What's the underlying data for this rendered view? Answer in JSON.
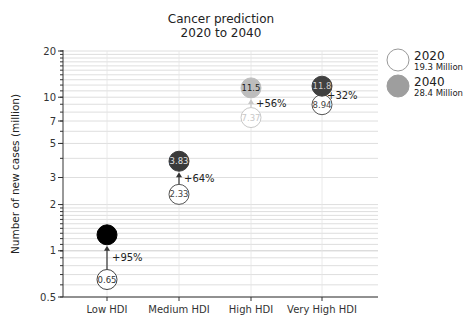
{
  "chart_data": {
    "type": "scatter",
    "title": "Cancer prediction\n2020 to 2040",
    "title_lines": [
      "Cancer prediction",
      "2020 to 2040"
    ],
    "xlabel": "",
    "ylabel": "Number of new cases (million)",
    "yscale": "log",
    "ylim": [
      0.5,
      20
    ],
    "yticks": [
      0.5,
      1,
      2,
      3,
      5,
      7,
      10,
      20
    ],
    "ytick_labels": [
      "0.5",
      "1",
      "2",
      "3",
      "5",
      "7",
      "10",
      "20"
    ],
    "categories": [
      "Low HDI",
      "Medium HDI",
      "High HDI",
      "Very High HDI"
    ],
    "grid": true,
    "legend_position": "right",
    "series": [
      {
        "name": "2020",
        "subtitle": "19.3 Million",
        "values": [
          0.65,
          2.33,
          7.37,
          8.94
        ],
        "labels": [
          "0.65",
          "2.33",
          "7.37",
          "8.94"
        ],
        "style": "hollow"
      },
      {
        "name": "2040",
        "subtitle": "28.4 Million",
        "values": [
          1.27,
          3.83,
          11.5,
          11.8
        ],
        "labels": [
          "1.27",
          "3.83",
          "11.5",
          "11.8"
        ],
        "style": "filled"
      }
    ],
    "annotations": [
      "+95%",
      "+64%",
      "+56%",
      "+32%"
    ],
    "fill_colors_2040": [
      "#000000",
      "#3a3a3a",
      "#bdbdbd",
      "#404040"
    ],
    "label_colors_2040": [
      "#000000",
      "#e0e0e0",
      "#222222",
      "#cfcfcf"
    ],
    "edge_colors_2020": [
      "#444444",
      "#555555",
      "#c8c8c8",
      "#555555"
    ],
    "label_colors_2020": [
      "#333333",
      "#444444",
      "#c8c8c8",
      "#444444"
    ]
  },
  "legend": {
    "items": [
      {
        "year": "2020",
        "total": "19.3 Million"
      },
      {
        "year": "2040",
        "total": "28.4 Million"
      }
    ]
  }
}
